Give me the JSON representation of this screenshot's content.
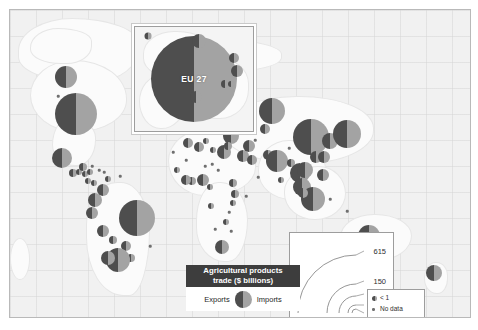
{
  "figure": {
    "type": "choropleth-proportional-symbol-map"
  },
  "inset": {
    "name": "eu-inset",
    "label": "EU 27"
  },
  "legend": {
    "title_line1": "Agricultural products",
    "title_line2": "trade ($ billions)",
    "exports_label": "Exports",
    "imports_label": "Imports",
    "export_color": "#4e4e4e",
    "import_color": "#a3a3a3"
  },
  "scale": {
    "name": "size-scale",
    "values": [
      "615",
      "150",
      "50",
      "10",
      "1"
    ]
  },
  "extra_keys": {
    "less_than_one": "< 1",
    "no_data": "No data"
  },
  "chart_data": {
    "type": "scatter",
    "title": "Agricultural products trade ($ billions)",
    "xlabel": "Longitude",
    "ylabel": "Latitude",
    "legend_position": "bottom-center",
    "symbol_encoding": {
      "area": "total agricultural trade ($ billions)",
      "left_half_dark": "Exports",
      "right_half_light": "Imports"
    },
    "size_breaks": [
      615,
      150,
      50,
      10,
      1
    ],
    "series": [
      {
        "name": "Exports",
        "color": "#4e4e4e"
      },
      {
        "name": "Imports",
        "color": "#a3a3a3"
      }
    ],
    "points": [
      {
        "label": "EU 27 (inset)",
        "x": 184,
        "y": 74,
        "r": 43,
        "exports": 615,
        "imports": 600
      },
      {
        "label": "EU 27 (on map)",
        "x": 192,
        "y": 90,
        "r": 6,
        "exports": 9,
        "imports": 9
      },
      {
        "label": "Canada",
        "x": 66,
        "y": 77,
        "r": 11,
        "exports": 44,
        "imports": 30
      },
      {
        "label": "United States",
        "x": 76,
        "y": 114,
        "r": 21,
        "exports": 150,
        "imports": 110
      },
      {
        "label": "Mexico",
        "x": 62,
        "y": 158,
        "r": 10,
        "exports": 20,
        "imports": 24
      },
      {
        "label": "Guatemala",
        "x": 73,
        "y": 173,
        "r": 4,
        "exports": 5,
        "imports": 3
      },
      {
        "label": "Honduras",
        "x": 79,
        "y": 172,
        "r": 3,
        "exports": 3,
        "imports": 2
      },
      {
        "label": "Cuba",
        "x": 83,
        "y": 167,
        "r": 4,
        "exports": 2,
        "imports": 3
      },
      {
        "label": "Jamaica",
        "x": 85,
        "y": 174,
        "r": 3,
        "exports": 1,
        "imports": 2
      },
      {
        "label": "Dominican Rep.",
        "x": 90,
        "y": 172,
        "r": 3,
        "exports": 2,
        "imports": 2
      },
      {
        "label": "Costa Rica",
        "x": 88,
        "y": 181,
        "r": 3,
        "exports": 3,
        "imports": 2
      },
      {
        "label": "Panama",
        "x": 94,
        "y": 183,
        "r": 3,
        "exports": 1,
        "imports": 1
      },
      {
        "label": "Trinidad",
        "x": 108,
        "y": 179,
        "r": 3,
        "exports": 1,
        "imports": 1
      },
      {
        "label": "Venezuela",
        "x": 103,
        "y": 190,
        "r": 6,
        "exports": 2,
        "imports": 7
      },
      {
        "label": "Colombia",
        "x": 95,
        "y": 200,
        "r": 7,
        "exports": 8,
        "imports": 5
      },
      {
        "label": "Ecuador",
        "x": 92,
        "y": 213,
        "r": 6,
        "exports": 7,
        "imports": 3
      },
      {
        "label": "Peru",
        "x": 103,
        "y": 231,
        "r": 6,
        "exports": 6,
        "imports": 4
      },
      {
        "label": "Bolivia",
        "x": 113,
        "y": 240,
        "r": 4,
        "exports": 2,
        "imports": 1
      },
      {
        "label": "Brazil",
        "x": 137,
        "y": 218,
        "r": 18,
        "exports": 90,
        "imports": 25
      },
      {
        "label": "Paraguay",
        "x": 126,
        "y": 246,
        "r": 5,
        "exports": 6,
        "imports": 1
      },
      {
        "label": "Uruguay",
        "x": 131,
        "y": 258,
        "r": 4,
        "exports": 4,
        "imports": 1
      },
      {
        "label": "Argentina",
        "x": 118,
        "y": 260,
        "r": 12,
        "exports": 40,
        "imports": 4
      },
      {
        "label": "Chile",
        "x": 108,
        "y": 258,
        "r": 7,
        "exports": 14,
        "imports": 5
      },
      {
        "label": "Morocco",
        "x": 188,
        "y": 143,
        "r": 5,
        "exports": 3,
        "imports": 5
      },
      {
        "label": "Algeria",
        "x": 199,
        "y": 147,
        "r": 5,
        "exports": 1,
        "imports": 9
      },
      {
        "label": "Tunisia",
        "x": 206,
        "y": 141,
        "r": 3,
        "exports": 1,
        "imports": 2
      },
      {
        "label": "Libya",
        "x": 213,
        "y": 150,
        "r": 3,
        "exports": 1,
        "imports": 3
      },
      {
        "label": "Egypt",
        "x": 224,
        "y": 152,
        "r": 7,
        "exports": 4,
        "imports": 12
      },
      {
        "label": "Senegal",
        "x": 177,
        "y": 170,
        "r": 3,
        "exports": 1,
        "imports": 2
      },
      {
        "label": "Ghana",
        "x": 192,
        "y": 181,
        "r": 4,
        "exports": 3,
        "imports": 2
      },
      {
        "label": "Nigeria",
        "x": 203,
        "y": 180,
        "r": 6,
        "exports": 2,
        "imports": 8
      },
      {
        "label": "Cote d'Ivoire",
        "x": 186,
        "y": 180,
        "r": 5,
        "exports": 5,
        "imports": 2
      },
      {
        "label": "Cameroon",
        "x": 210,
        "y": 187,
        "r": 3,
        "exports": 2,
        "imports": 1
      },
      {
        "label": "Ethiopia",
        "x": 233,
        "y": 183,
        "r": 4,
        "exports": 2,
        "imports": 1
      },
      {
        "label": "Kenya",
        "x": 235,
        "y": 194,
        "r": 4,
        "exports": 3,
        "imports": 2
      },
      {
        "label": "Tanzania",
        "x": 233,
        "y": 203,
        "r": 3,
        "exports": 2,
        "imports": 1
      },
      {
        "label": "Angola",
        "x": 211,
        "y": 206,
        "r": 3,
        "exports": 1,
        "imports": 2
      },
      {
        "label": "Zimbabwe",
        "x": 226,
        "y": 222,
        "r": 3,
        "exports": 1,
        "imports": 1
      },
      {
        "label": "South Africa",
        "x": 222,
        "y": 247,
        "r": 7,
        "exports": 8,
        "imports": 6
      },
      {
        "label": "Turkey",
        "x": 231,
        "y": 136,
        "r": 8,
        "exports": 11,
        "imports": 10
      },
      {
        "label": "Israel",
        "x": 228,
        "y": 146,
        "r": 4,
        "exports": 2,
        "imports": 3
      },
      {
        "label": "Saudi Arabia",
        "x": 243,
        "y": 156,
        "r": 6,
        "exports": 2,
        "imports": 11
      },
      {
        "label": "UAE",
        "x": 252,
        "y": 160,
        "r": 5,
        "exports": 3,
        "imports": 7
      },
      {
        "label": "Iran",
        "x": 249,
        "y": 146,
        "r": 6,
        "exports": 3,
        "imports": 9
      },
      {
        "label": "Russia",
        "x": 272,
        "y": 111,
        "r": 13,
        "exports": 15,
        "imports": 40
      },
      {
        "label": "Ukraine",
        "x": 238,
        "y": 123,
        "r": 7,
        "exports": 12,
        "imports": 5
      },
      {
        "label": "Kazakhstan",
        "x": 265,
        "y": 129,
        "r": 5,
        "exports": 3,
        "imports": 3
      },
      {
        "label": "Pakistan",
        "x": 268,
        "y": 155,
        "r": 5,
        "exports": 4,
        "imports": 4
      },
      {
        "label": "India",
        "x": 277,
        "y": 161,
        "r": 11,
        "exports": 25,
        "imports": 12
      },
      {
        "label": "Bangladesh",
        "x": 291,
        "y": 163,
        "r": 4,
        "exports": 1,
        "imports": 5
      },
      {
        "label": "Sri Lanka",
        "x": 281,
        "y": 180,
        "r": 3,
        "exports": 2,
        "imports": 2
      },
      {
        "label": "Thailand",
        "x": 300,
        "y": 173,
        "r": 10,
        "exports": 28,
        "imports": 10
      },
      {
        "label": "Vietnam",
        "x": 305,
        "y": 170,
        "r": 8,
        "exports": 16,
        "imports": 9
      },
      {
        "label": "Malaysia",
        "x": 302,
        "y": 187,
        "r": 9,
        "exports": 22,
        "imports": 13
      },
      {
        "label": "Indonesia",
        "x": 313,
        "y": 199,
        "r": 12,
        "exports": 33,
        "imports": 16
      },
      {
        "label": "Philippines",
        "x": 323,
        "y": 175,
        "r": 6,
        "exports": 5,
        "imports": 7
      },
      {
        "label": "Singapore",
        "x": 303,
        "y": 193,
        "r": 5,
        "exports": 5,
        "imports": 7
      },
      {
        "label": "China",
        "x": 311,
        "y": 137,
        "r": 18,
        "exports": 48,
        "imports": 95
      },
      {
        "label": "Hong Kong",
        "x": 316,
        "y": 157,
        "r": 6,
        "exports": 4,
        "imports": 7
      },
      {
        "label": "Taiwan",
        "x": 324,
        "y": 157,
        "r": 6,
        "exports": 4,
        "imports": 8
      },
      {
        "label": "South Korea",
        "x": 330,
        "y": 141,
        "r": 8,
        "exports": 5,
        "imports": 18
      },
      {
        "label": "Japan",
        "x": 347,
        "y": 134,
        "r": 14,
        "exports": 5,
        "imports": 60
      },
      {
        "label": "Australia",
        "x": 369,
        "y": 236,
        "r": 11,
        "exports": 30,
        "imports": 12
      },
      {
        "label": "New Zealand",
        "x": 434,
        "y": 273,
        "r": 8,
        "exports": 18,
        "imports": 4
      }
    ]
  }
}
